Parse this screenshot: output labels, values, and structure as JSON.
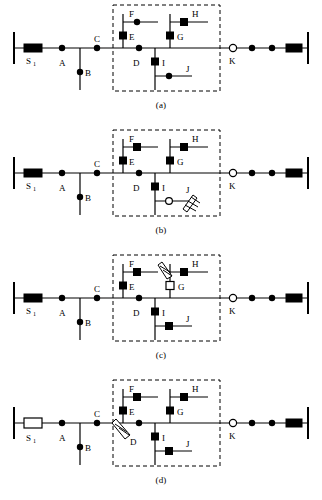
{
  "figure": {
    "panel_count": 4,
    "colors": {
      "line": "#000000",
      "device_fill": "#000000",
      "device_open_fill": "#ffffff",
      "zone_border": "#000000",
      "background": "#ffffff"
    },
    "legend_notes": {
      "filled_square": "closed switch / sectionalizing device",
      "open_square": "open (tripped) switch",
      "filled_circle": "closed node / load tap",
      "open_circle": "open tie point",
      "filled_rect": "closed breaker",
      "open_rect": "open (tripped) breaker",
      "arrow_zigzag": "fault location indicator"
    }
  },
  "panels": [
    {
      "id": "a",
      "caption": "(a)",
      "source_label": "S",
      "source_sub": "1",
      "source_state": "closed",
      "end_breaker_state": "closed",
      "tie_label": "K",
      "tie_state": "open",
      "fault": null,
      "nodes": [
        {
          "label": "A",
          "shape": "circle",
          "state": "closed"
        },
        {
          "label": "B",
          "shape": "circle",
          "state": "closed"
        },
        {
          "label": "C",
          "shape": "circle",
          "state": "closed"
        },
        {
          "label": "D",
          "shape": "circle",
          "state": "closed"
        },
        {
          "label": "E",
          "shape": "square",
          "state": "closed"
        },
        {
          "label": "F",
          "shape": "circle",
          "state": "closed"
        },
        {
          "label": "G",
          "shape": "square",
          "state": "closed"
        },
        {
          "label": "H",
          "shape": "square",
          "state": "closed"
        },
        {
          "label": "I",
          "shape": "square",
          "state": "closed"
        },
        {
          "label": "J",
          "shape": "circle",
          "state": "closed"
        },
        {
          "label": "K",
          "shape": "circle",
          "state": "open"
        }
      ]
    },
    {
      "id": "b",
      "caption": "(b)",
      "source_label": "S",
      "source_sub": "1",
      "source_state": "closed",
      "end_breaker_state": "closed",
      "tie_label": "K",
      "tie_state": "open",
      "fault": {
        "at": "J",
        "type": "arrow-zigzag"
      },
      "nodes": [
        {
          "label": "A",
          "shape": "circle",
          "state": "closed"
        },
        {
          "label": "B",
          "shape": "circle",
          "state": "closed"
        },
        {
          "label": "C",
          "shape": "circle",
          "state": "closed"
        },
        {
          "label": "D",
          "shape": "circle",
          "state": "closed"
        },
        {
          "label": "E",
          "shape": "square",
          "state": "closed"
        },
        {
          "label": "F",
          "shape": "square",
          "state": "closed"
        },
        {
          "label": "G",
          "shape": "square",
          "state": "closed"
        },
        {
          "label": "H",
          "shape": "square",
          "state": "closed"
        },
        {
          "label": "I",
          "shape": "square",
          "state": "closed"
        },
        {
          "label": "J",
          "shape": "circle",
          "state": "open"
        },
        {
          "label": "K",
          "shape": "circle",
          "state": "open"
        }
      ]
    },
    {
      "id": "c",
      "caption": "(c)",
      "source_label": "S",
      "source_sub": "1",
      "source_state": "closed",
      "end_breaker_state": "closed",
      "tie_label": "K",
      "tie_state": "open",
      "fault": {
        "at": "G",
        "type": "arrow-zigzag"
      },
      "nodes": [
        {
          "label": "A",
          "shape": "circle",
          "state": "closed"
        },
        {
          "label": "B",
          "shape": "circle",
          "state": "closed"
        },
        {
          "label": "C",
          "shape": "circle",
          "state": "closed"
        },
        {
          "label": "D",
          "shape": "circle",
          "state": "closed"
        },
        {
          "label": "E",
          "shape": "square",
          "state": "closed"
        },
        {
          "label": "F",
          "shape": "square",
          "state": "closed"
        },
        {
          "label": "G",
          "shape": "square",
          "state": "open"
        },
        {
          "label": "H",
          "shape": "square",
          "state": "closed"
        },
        {
          "label": "I",
          "shape": "square",
          "state": "closed"
        },
        {
          "label": "J",
          "shape": "square",
          "state": "closed"
        },
        {
          "label": "K",
          "shape": "circle",
          "state": "open"
        }
      ]
    },
    {
      "id": "d",
      "caption": "(d)",
      "source_label": "S",
      "source_sub": "1",
      "source_state": "open",
      "end_breaker_state": "closed",
      "tie_label": "K",
      "tie_state": "open",
      "fault": {
        "at": "D",
        "type": "arrow-zigzag"
      },
      "nodes": [
        {
          "label": "A",
          "shape": "circle",
          "state": "closed"
        },
        {
          "label": "B",
          "shape": "circle",
          "state": "closed"
        },
        {
          "label": "C",
          "shape": "circle",
          "state": "closed"
        },
        {
          "label": "D",
          "shape": "circle",
          "state": "closed"
        },
        {
          "label": "E",
          "shape": "square",
          "state": "closed"
        },
        {
          "label": "F",
          "shape": "square",
          "state": "closed"
        },
        {
          "label": "G",
          "shape": "square",
          "state": "closed"
        },
        {
          "label": "H",
          "shape": "square",
          "state": "closed"
        },
        {
          "label": "I",
          "shape": "square",
          "state": "closed"
        },
        {
          "label": "J",
          "shape": "square",
          "state": "closed"
        },
        {
          "label": "K",
          "shape": "circle",
          "state": "open"
        }
      ]
    }
  ]
}
